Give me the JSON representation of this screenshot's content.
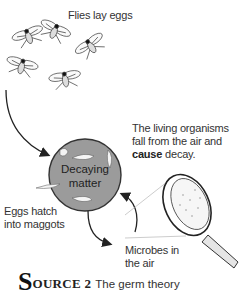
{
  "diagram": {
    "labels": {
      "flies": "Flies lay eggs",
      "organisms_line1": "The living organisms",
      "organisms_line2": "fall from the air and",
      "organisms_bold": "cause",
      "organisms_end": " decay.",
      "center_line1": "Decaying",
      "center_line2": "matter",
      "eggs_line1": "Eggs hatch",
      "eggs_line2": "into maggots",
      "microbes_line1": "Microbes in",
      "microbes_line2": "the air"
    },
    "colors": {
      "circle_fill": "#9b9b9b",
      "line": "#222222"
    }
  },
  "caption": {
    "initial": "S",
    "rest": "OURCE 2",
    "title": "The germ theory"
  }
}
